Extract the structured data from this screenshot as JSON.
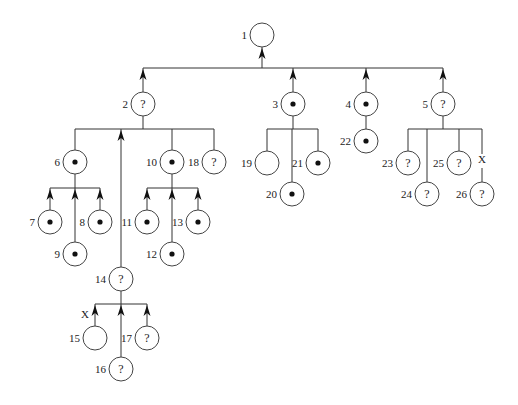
{
  "diagram": {
    "type": "tree",
    "node_radius": 12,
    "colors": {
      "line": "#333333",
      "node_stroke": "#444444",
      "dot": "#111111",
      "background": "#ffffff"
    },
    "nodes": [
      {
        "id": "1",
        "label": "1",
        "x": 262,
        "y": 35,
        "mark": "empty"
      },
      {
        "id": "2",
        "label": "2",
        "x": 143,
        "y": 104,
        "mark": "?"
      },
      {
        "id": "3",
        "label": "3",
        "x": 293,
        "y": 104,
        "mark": "dot"
      },
      {
        "id": "4",
        "label": "4",
        "x": 366,
        "y": 104,
        "mark": "dot"
      },
      {
        "id": "5",
        "label": "5",
        "x": 443,
        "y": 104,
        "mark": "?"
      },
      {
        "id": "6",
        "label": "6",
        "x": 75,
        "y": 162,
        "mark": "dot"
      },
      {
        "id": "7",
        "label": "7",
        "x": 50,
        "y": 222,
        "mark": "dot"
      },
      {
        "id": "8",
        "label": "8",
        "x": 100,
        "y": 222,
        "mark": "dot"
      },
      {
        "id": "9",
        "label": "9",
        "x": 75,
        "y": 254,
        "mark": "dot"
      },
      {
        "id": "10",
        "label": "10",
        "x": 172,
        "y": 162,
        "mark": "dot"
      },
      {
        "id": "11",
        "label": "11",
        "x": 147,
        "y": 222,
        "mark": "dot"
      },
      {
        "id": "12",
        "label": "12",
        "x": 172,
        "y": 254,
        "mark": "dot"
      },
      {
        "id": "13",
        "label": "13",
        "x": 198,
        "y": 222,
        "mark": "dot"
      },
      {
        "id": "14",
        "label": "14",
        "x": 121,
        "y": 279,
        "mark": "?"
      },
      {
        "id": "15",
        "label": "15",
        "x": 95,
        "y": 338,
        "mark": "empty"
      },
      {
        "id": "16",
        "label": "16",
        "x": 121,
        "y": 369,
        "mark": "?"
      },
      {
        "id": "17",
        "label": "17",
        "x": 147,
        "y": 338,
        "mark": "?"
      },
      {
        "id": "18",
        "label": "18",
        "x": 214,
        "y": 162,
        "mark": "?"
      },
      {
        "id": "19",
        "label": "19",
        "x": 267,
        "y": 163,
        "mark": "empty"
      },
      {
        "id": "20",
        "label": "20",
        "x": 292,
        "y": 194,
        "mark": "dot"
      },
      {
        "id": "21",
        "label": "21",
        "x": 318,
        "y": 163,
        "mark": "dot"
      },
      {
        "id": "22",
        "label": "22",
        "x": 366,
        "y": 141,
        "mark": "dot"
      },
      {
        "id": "23",
        "label": "23",
        "x": 408,
        "y": 163,
        "mark": "?"
      },
      {
        "id": "24",
        "label": "24",
        "x": 427,
        "y": 194,
        "mark": "?"
      },
      {
        "id": "25",
        "label": "25",
        "x": 459,
        "y": 163,
        "mark": "?"
      },
      {
        "id": "26",
        "label": "26",
        "x": 482,
        "y": 194,
        "mark": "?"
      }
    ],
    "groups": [
      {
        "parent": "1",
        "bar_y": 68,
        "bar_x1": 143,
        "bar_x2": 443,
        "arrow_up_to_parent": true,
        "children": [
          {
            "id": "2",
            "arrow": true
          },
          {
            "id": "3",
            "arrow": true
          },
          {
            "id": "4",
            "arrow": true
          },
          {
            "id": "5",
            "arrow": true
          }
        ]
      },
      {
        "parent": "2",
        "bar_y": 129,
        "bar_x1": 75,
        "bar_x2": 214,
        "arrow_up_to_parent": false,
        "children": [
          {
            "id": "6",
            "arrow": false
          },
          {
            "id": "14",
            "arrow": true,
            "x": 121
          },
          {
            "id": "10",
            "arrow": false
          },
          {
            "id": "18",
            "arrow": false
          }
        ]
      },
      {
        "parent": "6",
        "bar_y": 188,
        "bar_x1": 50,
        "bar_x2": 100,
        "arrow_up_to_parent": false,
        "children": [
          {
            "id": "7",
            "arrow": true
          },
          {
            "id": "9",
            "arrow": true
          },
          {
            "id": "8",
            "arrow": true
          }
        ]
      },
      {
        "parent": "10",
        "bar_y": 188,
        "bar_x1": 147,
        "bar_x2": 198,
        "arrow_up_to_parent": false,
        "children": [
          {
            "id": "11",
            "arrow": true
          },
          {
            "id": "12",
            "arrow": true
          },
          {
            "id": "13",
            "arrow": true
          }
        ]
      },
      {
        "parent": "14",
        "bar_y": 304,
        "bar_x1": 95,
        "bar_x2": 147,
        "arrow_up_to_parent": false,
        "children": [
          {
            "id": "15",
            "arrow": true,
            "x_mark": true
          },
          {
            "id": "16",
            "arrow": true
          },
          {
            "id": "17",
            "arrow": true
          }
        ]
      },
      {
        "parent": "3",
        "bar_y": 129,
        "bar_x1": 267,
        "bar_x2": 318,
        "arrow_up_to_parent": false,
        "children": [
          {
            "id": "19",
            "arrow": false
          },
          {
            "id": "20",
            "arrow": false
          },
          {
            "id": "21",
            "arrow": false
          }
        ]
      },
      {
        "parent": "4",
        "bar_y": null,
        "direct": true,
        "children": [
          {
            "id": "22",
            "arrow": false
          }
        ]
      },
      {
        "parent": "5",
        "bar_y": 129,
        "bar_x1": 408,
        "bar_x2": 482,
        "arrow_up_to_parent": false,
        "children": [
          {
            "id": "23",
            "arrow": false
          },
          {
            "id": "24",
            "arrow": false
          },
          {
            "id": "25",
            "arrow": false
          },
          {
            "id": "26",
            "arrow": false,
            "x_mark": true
          }
        ]
      }
    ],
    "x_marks": [
      {
        "label": "X",
        "x": 85,
        "y": 318,
        "near": "15"
      },
      {
        "label": "X",
        "x": 482,
        "y": 163,
        "near": "26"
      }
    ],
    "symbols": {
      "question": "?",
      "x": "X"
    }
  }
}
